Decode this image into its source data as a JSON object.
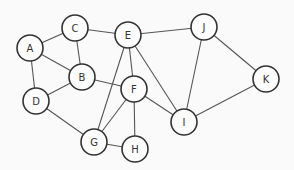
{
  "graph": {
    "title": "",
    "node_radius": 13,
    "nodes": [
      {
        "id": "A",
        "label": "A",
        "x": 30,
        "y": 48
      },
      {
        "id": "C",
        "label": "C",
        "x": 75,
        "y": 28
      },
      {
        "id": "E",
        "label": "E",
        "x": 128,
        "y": 35
      },
      {
        "id": "J",
        "label": "J",
        "x": 204,
        "y": 27
      },
      {
        "id": "B",
        "label": "B",
        "x": 82,
        "y": 77
      },
      {
        "id": "F",
        "label": "F",
        "x": 134,
        "y": 89
      },
      {
        "id": "D",
        "label": "D",
        "x": 36,
        "y": 101
      },
      {
        "id": "K",
        "label": "K",
        "x": 266,
        "y": 79
      },
      {
        "id": "I",
        "label": "I",
        "x": 184,
        "y": 122
      },
      {
        "id": "G",
        "label": "G",
        "x": 94,
        "y": 142
      },
      {
        "id": "H",
        "label": "H",
        "x": 135,
        "y": 149
      }
    ],
    "edges": [
      [
        "A",
        "C"
      ],
      [
        "A",
        "B"
      ],
      [
        "A",
        "D"
      ],
      [
        "C",
        "B"
      ],
      [
        "C",
        "E"
      ],
      [
        "E",
        "J"
      ],
      [
        "E",
        "F"
      ],
      [
        "E",
        "G"
      ],
      [
        "E",
        "I"
      ],
      [
        "B",
        "F"
      ],
      [
        "B",
        "D"
      ],
      [
        "D",
        "G"
      ],
      [
        "F",
        "G"
      ],
      [
        "F",
        "H"
      ],
      [
        "F",
        "I"
      ],
      [
        "G",
        "H"
      ],
      [
        "J",
        "I"
      ],
      [
        "J",
        "K"
      ],
      [
        "K",
        "I"
      ]
    ]
  }
}
